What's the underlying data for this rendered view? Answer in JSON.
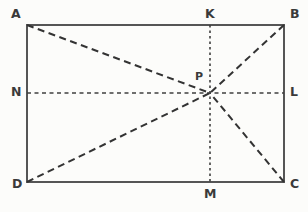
{
  "figure": {
    "type": "geometry-diagram",
    "background_color": "#fcfcfa",
    "stroke_color": "#555555",
    "dash_color": "#3a3a3a",
    "label_color": "#3a3a3a"
  },
  "rectangle": {
    "left": 27,
    "top": 25,
    "right": 284,
    "bottom": 182,
    "stroke_width": 2
  },
  "points": {
    "A": {
      "label": "A",
      "x": 27,
      "y": 25,
      "label_x": 11,
      "label_y": 8
    },
    "B": {
      "label": "B",
      "x": 284,
      "y": 25,
      "label_x": 290,
      "label_y": 8
    },
    "C": {
      "label": "C",
      "x": 284,
      "y": 182,
      "label_x": 290,
      "label_y": 178
    },
    "D": {
      "label": "D",
      "x": 27,
      "y": 182,
      "label_x": 12,
      "label_y": 178
    },
    "K": {
      "label": "K",
      "x": 210,
      "y": 25,
      "label_x": 205,
      "label_y": 8
    },
    "M": {
      "label": "M",
      "x": 210,
      "y": 182,
      "label_x": 204,
      "label_y": 188
    },
    "N": {
      "label": "N",
      "x": 27,
      "y": 93,
      "label_x": 11,
      "label_y": 86
    },
    "L": {
      "label": "L",
      "x": 284,
      "y": 93,
      "label_x": 290,
      "label_y": 86
    },
    "P": {
      "label": "P",
      "x": 210,
      "y": 93,
      "label_x": 195,
      "label_y": 71
    }
  },
  "segments": {
    "vertical_midline": {
      "name": "KM",
      "from": "K",
      "to": "M",
      "style": "dotted",
      "dash": "2.5 3"
    },
    "horizontal_midline": {
      "name": "NL",
      "from": "N",
      "to": "L",
      "style": "dashed",
      "dash": "4 3.5"
    },
    "diagonal_AP": {
      "name": "AP",
      "from": "A",
      "to": "P",
      "style": "dashed",
      "dash": "7 4.5"
    },
    "diagonal_BP": {
      "name": "BP",
      "from": "B",
      "to": "P",
      "style": "dashed",
      "dash": "7 4.5"
    },
    "diagonal_CP": {
      "name": "CP",
      "from": "C",
      "to": "P",
      "style": "dashed",
      "dash": "7 4.5"
    },
    "diagonal_DP": {
      "name": "DP",
      "from": "D",
      "to": "P",
      "style": "dashed",
      "dash": "7 4.5"
    }
  },
  "chart_data": {
    "type": "diagram",
    "title": "",
    "shape": "rectangle",
    "vertices": [
      {
        "name": "A",
        "x": 27,
        "y": 25
      },
      {
        "name": "B",
        "x": 284,
        "y": 25
      },
      {
        "name": "C",
        "x": 284,
        "y": 182
      },
      {
        "name": "D",
        "x": 27,
        "y": 182
      }
    ],
    "marked_points": [
      {
        "name": "K",
        "x": 210,
        "y": 25,
        "on": "AB"
      },
      {
        "name": "L",
        "x": 284,
        "y": 93,
        "on": "BC"
      },
      {
        "name": "M",
        "x": 210,
        "y": 182,
        "on": "DC"
      },
      {
        "name": "N",
        "x": 27,
        "y": 93,
        "on": "AD"
      },
      {
        "name": "P",
        "x": 210,
        "y": 93,
        "on": "intersection of KM and NL"
      }
    ],
    "lines": [
      {
        "from": "K",
        "to": "M",
        "style": "dotted"
      },
      {
        "from": "N",
        "to": "L",
        "style": "dashed"
      },
      {
        "from": "A",
        "to": "P",
        "style": "dashed"
      },
      {
        "from": "B",
        "to": "P",
        "style": "dashed"
      },
      {
        "from": "C",
        "to": "P",
        "style": "dashed"
      },
      {
        "from": "D",
        "to": "P",
        "style": "dashed"
      }
    ],
    "labels": [
      "A",
      "B",
      "C",
      "D",
      "K",
      "L",
      "M",
      "N",
      "P"
    ]
  }
}
